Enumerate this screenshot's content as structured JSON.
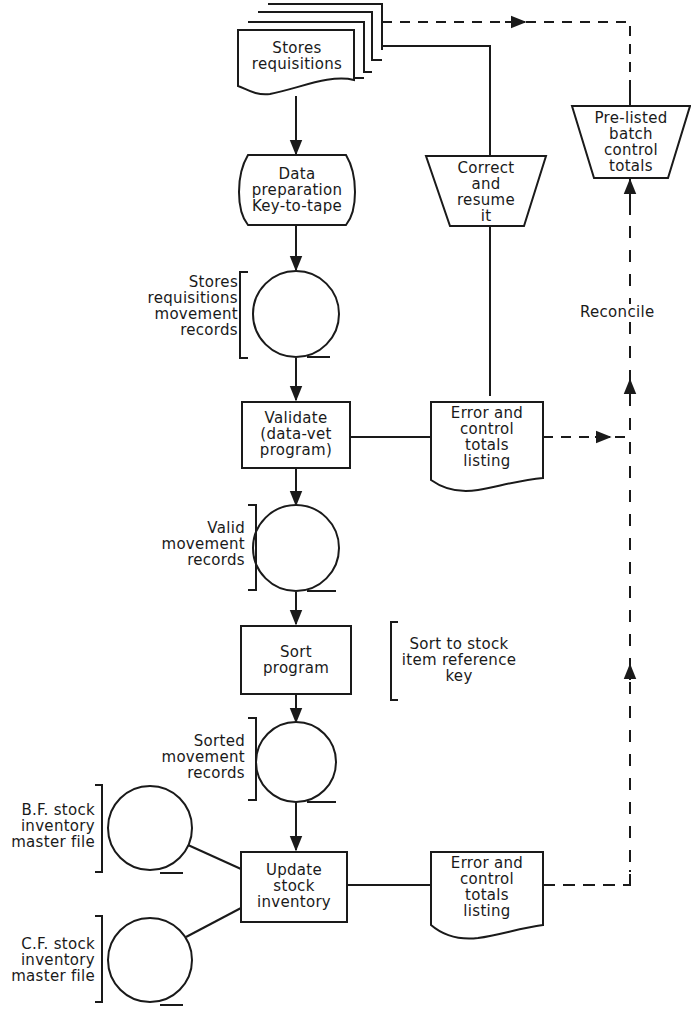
{
  "diagram": {
    "type": "system-flowchart",
    "nodes": {
      "stores_requisitions": {
        "label": "Stores\nrequisitions",
        "shape": "multi-document"
      },
      "data_preparation": {
        "label": "Data\npreparation\nKey-to-tape",
        "shape": "offline-keyboard"
      },
      "correct_resume": {
        "label": "Correct\nand\nresume\nit",
        "shape": "manual-operation"
      },
      "pre_listed_totals": {
        "label": "Pre-listed\nbatch\ncontrol\ntotals",
        "shape": "manual-operation"
      },
      "tape1": {
        "label": "Stores\nrequisitions\nmovement\nrecords",
        "shape": "magnetic-tape"
      },
      "validate": {
        "label": "Validate\n(data-vet\nprogram)",
        "shape": "process"
      },
      "error_listing_1": {
        "label": "Error and\ncontrol\ntotals\nlisting",
        "shape": "document"
      },
      "tape2": {
        "label": "Valid\nmovement\nrecords",
        "shape": "magnetic-tape"
      },
      "sort": {
        "label": "Sort\nprogram",
        "shape": "process"
      },
      "sort_note": {
        "label": "Sort to stock\nitem reference\nkey",
        "shape": "annotation"
      },
      "tape3": {
        "label": "Sorted\nmovement\nrecords",
        "shape": "magnetic-tape"
      },
      "bf_master": {
        "label": "B.F. stock\ninventory\nmaster file",
        "shape": "magnetic-tape"
      },
      "cf_master": {
        "label": "C.F. stock\ninventory\nmaster file",
        "shape": "magnetic-tape"
      },
      "update": {
        "label": "Update\nstock\ninventory",
        "shape": "process"
      },
      "error_listing_2": {
        "label": "Error and\ncontrol\ntotals\nlisting",
        "shape": "document"
      },
      "reconcile": {
        "label": "Reconcile",
        "shape": "annotation"
      }
    },
    "edges": [
      {
        "from": "stores_requisitions",
        "to": "data_preparation",
        "style": "solid",
        "arrow": true
      },
      {
        "from": "data_preparation",
        "to": "tape1",
        "style": "solid",
        "arrow": true
      },
      {
        "from": "tape1",
        "to": "validate",
        "style": "solid",
        "arrow": true
      },
      {
        "from": "validate",
        "to": "error_listing_1",
        "style": "solid",
        "arrow": false
      },
      {
        "from": "error_listing_1",
        "to": "correct_resume",
        "style": "solid",
        "arrow": false
      },
      {
        "from": "correct_resume",
        "to": "stores_requisitions",
        "style": "solid",
        "arrow": false
      },
      {
        "from": "validate",
        "to": "tape2",
        "style": "solid",
        "arrow": true
      },
      {
        "from": "tape2",
        "to": "sort",
        "style": "solid",
        "arrow": true
      },
      {
        "from": "sort",
        "to": "tape3",
        "style": "solid",
        "arrow": true
      },
      {
        "from": "tape3",
        "to": "update",
        "style": "solid",
        "arrow": true
      },
      {
        "from": "bf_master",
        "to": "update",
        "style": "solid",
        "arrow": false
      },
      {
        "from": "update",
        "to": "cf_master",
        "style": "solid",
        "arrow": false
      },
      {
        "from": "update",
        "to": "error_listing_2",
        "style": "solid",
        "arrow": false
      },
      {
        "from": "stores_requisitions",
        "to": "pre_listed_totals",
        "style": "dashed",
        "arrow": true
      },
      {
        "from": "error_listing_1",
        "to": "reconcile",
        "style": "dashed",
        "arrow": true
      },
      {
        "from": "error_listing_2",
        "to": "pre_listed_totals",
        "style": "dashed",
        "arrow": true
      }
    ]
  }
}
